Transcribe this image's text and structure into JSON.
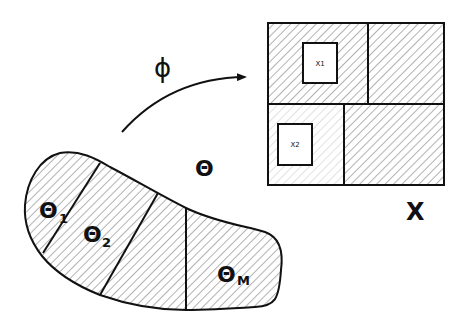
{
  "diagram": {
    "mapping_label": "ϕ",
    "source_space": {
      "label": "Θ",
      "regions": [
        {
          "label": "Θ",
          "subscript": "1"
        },
        {
          "label": "Θ",
          "subscript": "2"
        },
        {
          "label": "Θ",
          "subscript": "M"
        }
      ]
    },
    "target_space": {
      "label": "X",
      "samples": [
        {
          "label": "X1"
        },
        {
          "label": "X2"
        }
      ]
    }
  },
  "colors": {
    "stroke": "#111111",
    "hatch": "#555555",
    "hatch_light": "#b8b8b8",
    "background": "#ffffff"
  }
}
